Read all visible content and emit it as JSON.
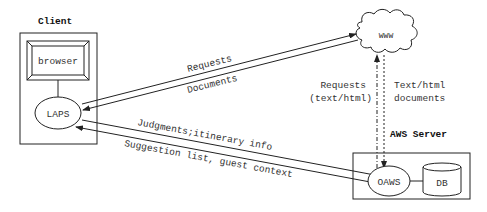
{
  "client": {
    "title": "Client",
    "browser_label": "browser",
    "laps_label": "LAPS"
  },
  "www": {
    "label": "WWW"
  },
  "server": {
    "title": "AWS Server",
    "oaws_label": "OAWS",
    "db_label": "DB"
  },
  "arrows": {
    "laps_to_www": "Requests",
    "www_to_laps": "Documents",
    "laps_to_oaws": "Judgments;itinerary info",
    "oaws_to_laps": "Suggestion list, guest context",
    "oaws_to_www_line1": "Requests",
    "oaws_to_www_line2": "(text/html)",
    "www_to_oaws_line1": "Text/html",
    "www_to_oaws_line2": "documents"
  },
  "colors": {
    "stroke": "#222222",
    "text": "#333333",
    "background": "#ffffff"
  }
}
